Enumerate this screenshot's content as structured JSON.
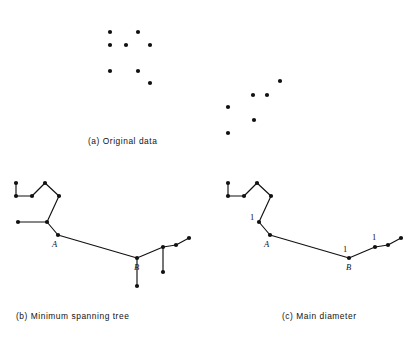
{
  "figure": {
    "background_color": "#ffffff",
    "ink_color": "#111111",
    "width": 415,
    "height": 349
  },
  "panels": [
    {
      "id": "a",
      "caption": "(a)  Original data",
      "caption_label": "(a)",
      "caption_text": "Original data"
    },
    {
      "id": "b",
      "caption": "(b)  Minimum spanning tree",
      "caption_label": "(b)",
      "caption_text": "Minimum spanning tree"
    },
    {
      "id": "c",
      "caption": "(c)  Main diameter",
      "caption_label": "(c)",
      "caption_text": "Main diameter"
    }
  ],
  "chart_data": {
    "type": "scatter",
    "xlabel": "",
    "ylabel": "",
    "grid": false,
    "legend": null,
    "panel_a": {
      "type": "scatter",
      "caption": "(a)  Original data",
      "clusters": [
        {
          "name": "left-cluster",
          "points": [
            [
              110,
              32
            ],
            [
              138,
              32
            ],
            [
              110,
              45
            ],
            [
              126,
              45
            ],
            [
              150,
              45
            ],
            [
              110,
              71
            ],
            [
              138,
              71
            ],
            [
              150,
              83
            ]
          ]
        },
        {
          "name": "right-cluster",
          "points": [
            [
              280,
              81
            ],
            [
              253,
              95
            ],
            [
              267,
              95
            ],
            [
              228,
              107
            ],
            [
              254,
              120
            ],
            [
              228,
              133
            ]
          ]
        }
      ]
    },
    "panel_b": {
      "type": "graph",
      "caption": "(b)  Minimum spanning tree",
      "nodes": [
        {
          "id": "n0",
          "x": 16,
          "y": 183
        },
        {
          "id": "n1",
          "x": 16,
          "y": 196
        },
        {
          "id": "n2",
          "x": 32,
          "y": 196
        },
        {
          "id": "n3",
          "x": 45,
          "y": 183
        },
        {
          "id": "n4",
          "x": 59,
          "y": 196
        },
        {
          "id": "n5",
          "x": 47,
          "y": 222
        },
        {
          "id": "n6",
          "x": 18,
          "y": 222
        },
        {
          "id": "A",
          "x": 58,
          "y": 235,
          "label": "A"
        },
        {
          "id": "B",
          "x": 137,
          "y": 258,
          "label": "B"
        },
        {
          "id": "n9",
          "x": 137,
          "y": 286
        },
        {
          "id": "n10",
          "x": 163,
          "y": 247
        },
        {
          "id": "n11",
          "x": 163,
          "y": 272
        },
        {
          "id": "n12",
          "x": 176,
          "y": 245
        },
        {
          "id": "n13",
          "x": 189,
          "y": 238
        }
      ],
      "edges": [
        [
          "n0",
          "n1"
        ],
        [
          "n1",
          "n2"
        ],
        [
          "n2",
          "n3"
        ],
        [
          "n3",
          "n4"
        ],
        [
          "n4",
          "n5"
        ],
        [
          "n5",
          "n6"
        ],
        [
          "n5",
          "A"
        ],
        [
          "A",
          "B"
        ],
        [
          "B",
          "n9"
        ],
        [
          "B",
          "n10"
        ],
        [
          "n10",
          "n11"
        ],
        [
          "n10",
          "n12"
        ],
        [
          "n12",
          "n13"
        ]
      ],
      "vertex_labels": [
        {
          "text": "A",
          "x": 52,
          "y": 247
        },
        {
          "text": "B",
          "x": 134,
          "y": 270
        }
      ]
    },
    "panel_c": {
      "type": "graph",
      "caption": "(c)  Main diameter",
      "nodes": [
        {
          "id": "m0",
          "x": 228,
          "y": 183
        },
        {
          "id": "m1",
          "x": 228,
          "y": 196
        },
        {
          "id": "m2",
          "x": 244,
          "y": 196
        },
        {
          "id": "m3",
          "x": 257,
          "y": 183
        },
        {
          "id": "m4",
          "x": 271,
          "y": 196
        },
        {
          "id": "m5",
          "x": 259,
          "y": 222
        },
        {
          "id": "A",
          "x": 270,
          "y": 235,
          "label": "A"
        },
        {
          "id": "B",
          "x": 349,
          "y": 258,
          "label": "B"
        },
        {
          "id": "m8",
          "x": 375,
          "y": 247
        },
        {
          "id": "m9",
          "x": 388,
          "y": 245
        },
        {
          "id": "m10",
          "x": 401,
          "y": 238
        }
      ],
      "edges": [
        [
          "m0",
          "m1"
        ],
        [
          "m1",
          "m2"
        ],
        [
          "m2",
          "m3"
        ],
        [
          "m3",
          "m4"
        ],
        [
          "m4",
          "m5"
        ],
        [
          "m5",
          "A"
        ],
        [
          "A",
          "B"
        ],
        [
          "B",
          "m8"
        ],
        [
          "m8",
          "m9"
        ],
        [
          "m9",
          "m10"
        ]
      ],
      "vertex_labels": [
        {
          "text": "A",
          "x": 264,
          "y": 247
        },
        {
          "text": "B",
          "x": 346,
          "y": 270
        }
      ],
      "weight_labels": [
        {
          "text": "1",
          "x": 250,
          "y": 220
        },
        {
          "text": "1",
          "x": 343,
          "y": 252
        },
        {
          "text": "1",
          "x": 372,
          "y": 240
        }
      ]
    }
  }
}
